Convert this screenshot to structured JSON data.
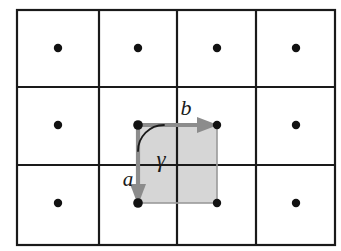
{
  "figure": {
    "width": 341,
    "height": 251,
    "background_color": "#ffffff"
  },
  "grid": {
    "name": "lattice-grid",
    "columns": 4,
    "rows": 3,
    "left": 17,
    "top": 10,
    "right": 335,
    "bottom": 245,
    "line_color": "#1a1a1a",
    "line_width": 2.2,
    "vertical_dividers": [
      99,
      177,
      256
    ],
    "horizontal_dividers": [
      87,
      165
    ]
  },
  "lattice_points": {
    "name": "lattice-point-dots",
    "color": "#121212",
    "radius": 4.2,
    "points": [
      {
        "id": "dot-r1-c1",
        "x": 58,
        "y": 48
      },
      {
        "id": "dot-r1-c2",
        "x": 138,
        "y": 48
      },
      {
        "id": "dot-r1-c3",
        "x": 217,
        "y": 48
      },
      {
        "id": "dot-r1-c4",
        "x": 296,
        "y": 48
      },
      {
        "id": "dot-r2-c1",
        "x": 58,
        "y": 125
      },
      {
        "id": "dot-r2-c2",
        "x": 138,
        "y": 125
      },
      {
        "id": "dot-r2-c3",
        "x": 217,
        "y": 125
      },
      {
        "id": "dot-r2-c4",
        "x": 296,
        "y": 125
      },
      {
        "id": "dot-r3-c1",
        "x": 58,
        "y": 203
      },
      {
        "id": "dot-r3-c2",
        "x": 138,
        "y": 203
      },
      {
        "id": "dot-r3-c3",
        "x": 217,
        "y": 203
      },
      {
        "id": "dot-r3-c4",
        "x": 296,
        "y": 203
      }
    ]
  },
  "unit_cell": {
    "name": "highlighted-unit-cell",
    "origin_x": 138,
    "origin_y": 125,
    "corner_x": 217,
    "corner_y": 203,
    "fill_color": "#d6d6d6",
    "edge_color": "#9a9a9a",
    "edge_width": 1.6
  },
  "vectors": {
    "color": "#8c8c8c",
    "shaft_width": 4.2,
    "a": {
      "name": "vector-a",
      "label": "a",
      "from_x": 138,
      "from_y": 125,
      "to_x": 138,
      "to_y": 203,
      "direction": "down",
      "label_x": 128,
      "label_y": 184
    },
    "b": {
      "name": "vector-b",
      "label": "b",
      "from_x": 138,
      "from_y": 125,
      "to_x": 217,
      "to_y": 125,
      "direction": "right",
      "label_x": 186,
      "label_y": 115
    }
  },
  "angle": {
    "name": "angle-gamma",
    "label": "γ",
    "value_degrees": 90,
    "arc_color": "#1a1a1a",
    "arc_width": 1.8,
    "arc_radius": 26,
    "label_x": 160,
    "label_y": 166
  }
}
